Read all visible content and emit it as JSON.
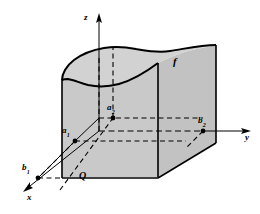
{
  "figure": {
    "kind": "3d-solid-under-surface-diagram",
    "background_color": "#ffffff",
    "stroke_color": "#000000",
    "fill_front_color": "#c9c9c9",
    "fill_side_color": "#c2c2c2",
    "fill_top_color": "#d2d2d2",
    "axes": [
      {
        "name": "z-axis",
        "label": "z",
        "direction": "up"
      },
      {
        "name": "y-axis",
        "label": "y",
        "direction": "right"
      },
      {
        "name": "x-axis",
        "label": "x",
        "direction": "down-left"
      }
    ],
    "points": [
      {
        "name": "a1",
        "label": "a",
        "subscript": "1"
      },
      {
        "name": "a2",
        "label": "a",
        "subscript": "2"
      },
      {
        "name": "b1",
        "label": "b",
        "subscript": "1"
      },
      {
        "name": "b2",
        "label": "b",
        "subscript": "2"
      }
    ],
    "region": {
      "name": "Q",
      "label": "Q"
    },
    "surface": {
      "name": "f",
      "label": "f"
    }
  },
  "labels": {
    "z": "z",
    "y": "y",
    "x": "x",
    "a1_base": "a",
    "a1_sub": "1",
    "a2_base": "a",
    "a2_sub": "2",
    "b1_base": "b",
    "b1_sub": "1",
    "b2_base": "b",
    "b2_sub": "2",
    "Q": "Q",
    "f": "f"
  }
}
